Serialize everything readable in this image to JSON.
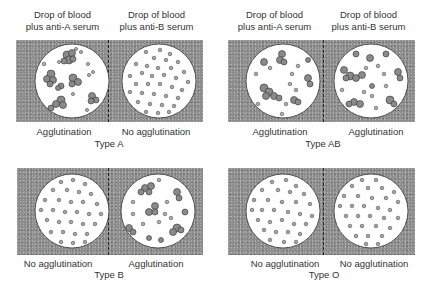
{
  "figure_title": "ABO blood typing by agglutination",
  "column_headers": {
    "left": [
      "Drop of blood",
      "plus anti-A serum"
    ],
    "right": [
      "Drop of blood",
      "plus anti-B serum"
    ]
  },
  "colors": {
    "background_panel": "#8d8d8d",
    "drop_fill": "#ffffff",
    "cell_fill": "#9a9a9a",
    "cell_outline": "#333333",
    "divider": "#222222"
  },
  "panels": [
    {
      "type_label": "Type A",
      "left_result": "Agglutination",
      "right_result": "No agglutination",
      "left_agglutinated": true,
      "right_agglutinated": false
    },
    {
      "type_label": "Type AB",
      "left_result": "Agglutination",
      "right_result": "Agglutination",
      "left_agglutinated": true,
      "right_agglutinated": true
    },
    {
      "type_label": "Type B",
      "left_result": "No agglutination",
      "right_result": "Agglutination",
      "left_agglutinated": false,
      "right_agglutinated": true
    },
    {
      "type_label": "Type O",
      "left_result": "No agglutination",
      "right_result": "No agglutination",
      "left_agglutinated": false,
      "right_agglutinated": false
    }
  ]
}
